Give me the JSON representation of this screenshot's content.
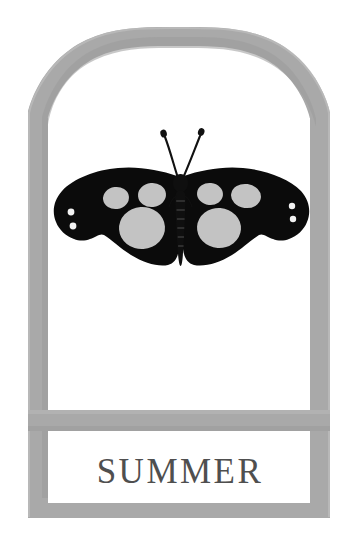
{
  "artwork": {
    "title": "SUMMER",
    "kind": "framed-butterfly-plaque",
    "background_color": "#ffffff"
  },
  "frame": {
    "name": "arched-plaque-frame",
    "border_color": "#a9a9a9",
    "border_shade_color": "#9a9a9a",
    "interior_color": "#ffffff",
    "border_thickness_px": 20,
    "outer_left_px": 28,
    "outer_right_px": 330,
    "outer_top_px": 27,
    "outer_bottom_px": 518,
    "arch_apex_y_px": 27,
    "shoulder_y_px": 112
  },
  "divider": {
    "name": "horizontal-divider-bar",
    "color": "#a9a9a9",
    "top_px": 410,
    "bottom_px": 431
  },
  "label_panel": {
    "name": "title-panel",
    "background_color": "#ffffff",
    "text": "SUMMER",
    "text_color": "#4f4f4f",
    "top_px": 431,
    "bottom_px": 503,
    "baseline_y_px": 483
  },
  "butterfly": {
    "name": "butterfly-specimen",
    "body_color": "#0b0b0b",
    "wing_color": "#0b0b0b",
    "spot_color": "#c3c3c3",
    "dot_color": "#f2f2f2",
    "center_x_px": 181,
    "wing_span_left_px": 55,
    "wing_span_right_px": 310,
    "wing_top_px": 168,
    "wing_bottom_px": 266,
    "antenna_tip_left": [
      163,
      132
    ],
    "antenna_tip_right": [
      201,
      130
    ],
    "spot_counts": {
      "left_wing_large_spots": 1,
      "left_wing_medium_spots": 2,
      "left_wing_small_dots": 2,
      "right_wing_large_spots": 1,
      "right_wing_medium_spots": 2,
      "right_wing_small_dots": 2
    }
  }
}
